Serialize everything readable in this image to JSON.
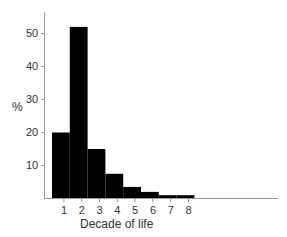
{
  "chart_data": {
    "type": "bar",
    "title": "",
    "xlabel": "Decade of life",
    "ylabel": "%",
    "categories": [
      "1",
      "2",
      "3",
      "4",
      "5",
      "6",
      "7",
      "8"
    ],
    "values": [
      20,
      52,
      15,
      7.5,
      3.5,
      2,
      1,
      1
    ],
    "ylim": [
      0,
      55
    ],
    "yticks": [
      10,
      20,
      30,
      40,
      50
    ],
    "grid": false,
    "legend": null,
    "bar_color": "#000000",
    "axis_color": "#999999"
  }
}
